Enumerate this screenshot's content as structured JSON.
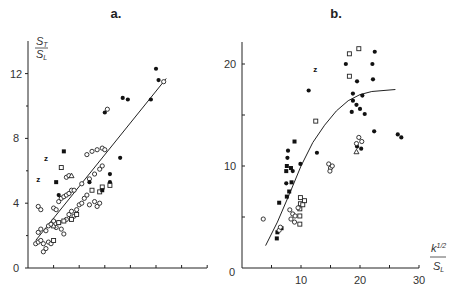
{
  "chart_data": [
    {
      "panel": "a.",
      "type": "scatter",
      "title": "a.",
      "ylabel_num": "S",
      "ylabel_num_sub": "T",
      "ylabel_den": "S",
      "ylabel_den_sub": "L",
      "xlabel": "",
      "ylim": [
        0,
        12
      ],
      "yticks": [
        "0",
        "4",
        "8",
        "12"
      ],
      "xticks_count": 7,
      "fit_line": {
        "x0": 0.3,
        "y0": 1.7,
        "x1": 5.4,
        "y1": 11.7
      },
      "series": [
        {
          "name": "open circles",
          "marker": "open-circle",
          "points": [
            [
              0.3,
              1.5
            ],
            [
              0.4,
              1.6
            ],
            [
              0.5,
              1.7
            ],
            [
              0.6,
              1.5
            ],
            [
              0.6,
              1.0
            ],
            [
              0.7,
              1.2
            ],
            [
              0.8,
              1.6
            ],
            [
              0.9,
              1.5
            ],
            [
              0.4,
              2.2
            ],
            [
              0.5,
              2.4
            ],
            [
              0.7,
              2.3
            ],
            [
              0.8,
              2.6
            ],
            [
              0.9,
              2.7
            ],
            [
              1.0,
              2.9
            ],
            [
              1.1,
              2.5
            ],
            [
              1.2,
              2.8
            ],
            [
              1.3,
              2.4
            ],
            [
              1.4,
              2.1
            ],
            [
              1.5,
              3.0
            ],
            [
              1.6,
              3.3
            ],
            [
              1.7,
              3.5
            ],
            [
              1.8,
              3.2
            ],
            [
              1.9,
              3.6
            ],
            [
              2.0,
              3.9
            ],
            [
              2.1,
              4.0
            ],
            [
              2.2,
              4.3
            ],
            [
              2.3,
              4.5
            ],
            [
              1.2,
              4.1
            ],
            [
              1.3,
              4.3
            ],
            [
              1.4,
              4.4
            ],
            [
              1.5,
              4.5
            ],
            [
              1.6,
              4.6
            ],
            [
              1.7,
              4.8
            ],
            [
              1.8,
              4.8
            ],
            [
              1.0,
              3.7
            ],
            [
              1.1,
              3.6
            ],
            [
              0.4,
              3.8
            ],
            [
              0.5,
              3.6
            ],
            [
              2.4,
              3.9
            ],
            [
              2.6,
              4.1
            ],
            [
              2.7,
              3.8
            ],
            [
              2.8,
              4.0
            ],
            [
              2.1,
              5.2
            ],
            [
              2.4,
              5.5
            ],
            [
              2.6,
              5.8
            ],
            [
              2.8,
              6.1
            ],
            [
              2.9,
              6.3
            ],
            [
              1.5,
              5.6
            ],
            [
              1.6,
              5.7
            ],
            [
              2.3,
              7.0
            ],
            [
              2.5,
              7.2
            ],
            [
              2.7,
              7.3
            ],
            [
              2.9,
              7.4
            ],
            [
              3.0,
              7.3
            ],
            [
              5.3,
              11.5
            ],
            [
              3.1,
              9.8
            ]
          ]
        },
        {
          "name": "filled circles",
          "marker": "filled-circle",
          "points": [
            [
              3.0,
              9.6
            ],
            [
              3.7,
              10.5
            ],
            [
              3.9,
              10.4
            ],
            [
              4.8,
              10.4
            ],
            [
              5.0,
              12.3
            ],
            [
              5.1,
              11.6
            ],
            [
              3.6,
              6.8
            ],
            [
              3.2,
              5.8
            ],
            [
              3.2,
              5.3
            ],
            [
              1.2,
              4.5
            ],
            [
              2.4,
              5.3
            ]
          ]
        },
        {
          "name": "open squares",
          "marker": "open-square",
          "points": [
            [
              1.2,
              2.8
            ],
            [
              1.4,
              2.9
            ],
            [
              1.7,
              3.0
            ],
            [
              1.9,
              3.3
            ],
            [
              2.8,
              4.7
            ],
            [
              2.9,
              5.0
            ],
            [
              3.2,
              5.1
            ],
            [
              2.5,
              4.8
            ],
            [
              1.3,
              6.2
            ],
            [
              1.0,
              1.7
            ]
          ]
        },
        {
          "name": "filled squares",
          "marker": "filled-square",
          "points": [
            [
              1.4,
              7.2
            ],
            [
              1.1,
              5.3
            ],
            [
              2.9,
              4.8
            ]
          ]
        },
        {
          "name": "triangles",
          "marker": "triangle",
          "points": [
            [
              1.7,
              5.7
            ],
            [
              1.0,
              2.6
            ]
          ]
        },
        {
          "name": "z markers",
          "marker": "z",
          "points": [
            [
              0.7,
              6.8
            ],
            [
              0.4,
              5.5
            ]
          ]
        }
      ]
    },
    {
      "panel": "b.",
      "type": "scatter",
      "title": "b.",
      "ylabel": "",
      "xlabel_num": "k",
      "xlabel_num_sup": "1/2",
      "xlabel_den": "S",
      "xlabel_den_sub": "L",
      "xlim": [
        0,
        30
      ],
      "ylim": [
        0,
        22
      ],
      "xticks": [
        "10",
        "20",
        "30"
      ],
      "yticks": [
        "0",
        "10",
        "20"
      ],
      "origin_label": "0",
      "fit_curve": [
        [
          4,
          2.2
        ],
        [
          6,
          4.5
        ],
        [
          8,
          7.2
        ],
        [
          10,
          10.0
        ],
        [
          12,
          12.3
        ],
        [
          14,
          14.0
        ],
        [
          16,
          15.4
        ],
        [
          18,
          16.4
        ],
        [
          20,
          17.0
        ],
        [
          22,
          17.3
        ],
        [
          26,
          17.5
        ]
      ],
      "series": [
        {
          "name": "filled circles",
          "marker": "filled-circle",
          "points": [
            [
              17.6,
              20.0
            ],
            [
              22.5,
              21.2
            ],
            [
              22.1,
              20.0
            ],
            [
              19.5,
              18.3
            ],
            [
              22.2,
              18.5
            ],
            [
              18.8,
              17.1
            ],
            [
              20.4,
              16.9
            ],
            [
              18.8,
              16.4
            ],
            [
              19.4,
              16.0
            ],
            [
              20.0,
              15.6
            ],
            [
              18.6,
              15.3
            ],
            [
              20.8,
              15.1
            ],
            [
              22.4,
              13.4
            ],
            [
              11.3,
              17.4
            ],
            [
              7.8,
              11.5
            ],
            [
              7.7,
              10.8
            ],
            [
              12.7,
              11.3
            ],
            [
              9.9,
              10.2
            ],
            [
              8.6,
              9.5
            ],
            [
              7.5,
              8.3
            ],
            [
              27.0,
              12.8
            ],
            [
              26.4,
              13.1
            ],
            [
              19.5,
              11.9
            ],
            [
              20.2,
              11.7
            ]
          ]
        },
        {
          "name": "filled squares",
          "marker": "filled-square",
          "points": [
            [
              7.6,
              10.0
            ],
            [
              7.5,
              9.5
            ],
            [
              8.3,
              9.8
            ],
            [
              8.4,
              8.4
            ],
            [
              7.6,
              7.0
            ],
            [
              6.3,
              6.4
            ],
            [
              5.9,
              2.9
            ],
            [
              6.0,
              3.5
            ],
            [
              6.7,
              3.9
            ],
            [
              8.0,
              7.5
            ],
            [
              8.9,
              12.4
            ]
          ]
        },
        {
          "name": "open squares",
          "marker": "open-square",
          "points": [
            [
              18.2,
              21.0
            ],
            [
              18.2,
              18.8
            ],
            [
              12.5,
              14.4
            ],
            [
              9.9,
              6.9
            ],
            [
              9.9,
              6.3
            ],
            [
              9.8,
              5.8
            ],
            [
              9.8,
              5.1
            ],
            [
              10.6,
              6.6
            ],
            [
              10.3,
              6.2
            ],
            [
              9.8,
              4.3
            ],
            [
              19.8,
              21.5
            ]
          ]
        },
        {
          "name": "open circles",
          "marker": "open-circle",
          "points": [
            [
              3.6,
              4.8
            ],
            [
              8.1,
              5.7
            ],
            [
              8.6,
              5.3
            ],
            [
              9.5,
              5.9
            ],
            [
              9.0,
              5.1
            ],
            [
              8.3,
              4.8
            ],
            [
              8.9,
              4.5
            ],
            [
              14.7,
              10.2
            ],
            [
              15.0,
              9.8
            ],
            [
              15.3,
              10.0
            ],
            [
              14.9,
              9.5
            ],
            [
              6.3,
              3.7
            ],
            [
              6.5,
              4.0
            ],
            [
              19.8,
              12.8
            ],
            [
              20.3,
              12.4
            ],
            [
              19.4,
              12.2
            ]
          ]
        },
        {
          "name": "triangles",
          "marker": "triangle",
          "points": [
            [
              19.4,
              11.4
            ]
          ]
        },
        {
          "name": "z markers",
          "marker": "z",
          "points": [
            [
              12.4,
              19.5
            ]
          ]
        }
      ]
    }
  ]
}
